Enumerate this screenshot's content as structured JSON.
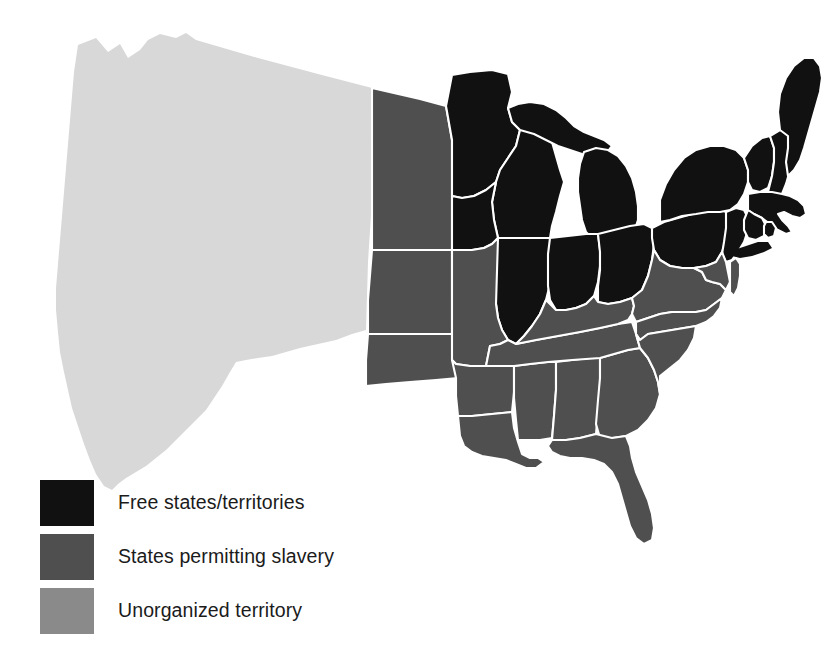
{
  "figure": {
    "type": "thematic-choropleth-map",
    "background_color": "#ffffff",
    "border_color": "#ffffff"
  },
  "palette": {
    "free": "#111111",
    "slave": "#4f4f4f",
    "unorganized": "#8a8a8a",
    "unorganized_map": "#d8d8d8"
  },
  "legend": {
    "items": [
      {
        "label": "Free states/territories",
        "color": "#111111",
        "swatch_name": "free-states-swatch"
      },
      {
        "label": "States permitting slavery",
        "color": "#4f4f4f",
        "swatch_name": "slave-states-swatch"
      },
      {
        "label": "Unorganized territory",
        "color": "#8a8a8a",
        "swatch_name": "unorganized-territory-swatch"
      }
    ]
  },
  "map_regions": {
    "free": [
      "Minnesota Territory",
      "Wisconsin",
      "Michigan",
      "Iowa",
      "Illinois",
      "Indiana",
      "Ohio",
      "Pennsylvania",
      "New York",
      "New Jersey",
      "Vermont",
      "New Hampshire",
      "Maine",
      "Massachusetts",
      "Connecticut",
      "Rhode Island"
    ],
    "slave": [
      "Nebraska Territory",
      "Kansas Territory",
      "Missouri",
      "Arkansas",
      "Indian Territory",
      "Louisiana",
      "Mississippi",
      "Alabama",
      "Tennessee",
      "Kentucky",
      "Virginia",
      "Maryland",
      "Delaware",
      "North Carolina",
      "South Carolina",
      "Georgia",
      "Florida"
    ],
    "unorganized": [
      "Oregon Territory",
      "Washington Territory",
      "Utah Territory",
      "New Mexico Territory",
      "California",
      "Texas (western portion)"
    ]
  }
}
